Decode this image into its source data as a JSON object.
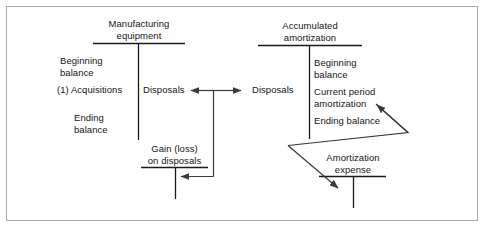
{
  "figure": {
    "type": "t-account-flow-diagram",
    "border_color": "#a9a9a9",
    "line_color": "#1a1a1a",
    "background": "#ffffff"
  },
  "accounts": {
    "manufacturing_equipment": {
      "title_line1": "Manufacturing",
      "title_line2": "equipment",
      "debit_entries": [
        "Beginning",
        "balance",
        "(1) Acquisitions",
        "Ending",
        "balance"
      ],
      "credit_entries": [
        "Disposals"
      ]
    },
    "accumulated_amortization": {
      "title_line1": "Accumulated",
      "title_line2": "amortization",
      "debit_entries": [
        "Disposals"
      ],
      "credit_entries": [
        "Beginning",
        "balance",
        "Current period",
        "amortization",
        "Ending balance"
      ]
    },
    "gain_loss_on_disposals": {
      "title_line1": "Gain (loss)",
      "title_line2": "on disposals",
      "debit_entries": [],
      "credit_entries": []
    },
    "amortization_expense": {
      "title_line1": "Amortization",
      "title_line2": "expense",
      "debit_entries": [],
      "credit_entries": []
    }
  },
  "labels": {
    "mfg_title_1": "Manufacturing",
    "mfg_title_2": "equipment",
    "mfg_beginning": "Beginning",
    "mfg_balance": "balance",
    "mfg_acquisitions": "(1) Acquisitions",
    "mfg_ending": "Ending",
    "mfg_ending_balance": "balance",
    "mfg_disposals": "Disposals",
    "acc_title_1": "Accumulated",
    "acc_title_2": "amortization",
    "acc_disposals": "Disposals",
    "acc_beginning": "Beginning",
    "acc_balance": "balance",
    "acc_current_period": "Current period",
    "acc_amortization": "amortization",
    "acc_ending_balance": "Ending balance",
    "gain_title_1": "Gain (loss)",
    "gain_title_2": "on disposals",
    "amort_exp_title_1": "Amortization",
    "amort_exp_title_2": "expense"
  }
}
